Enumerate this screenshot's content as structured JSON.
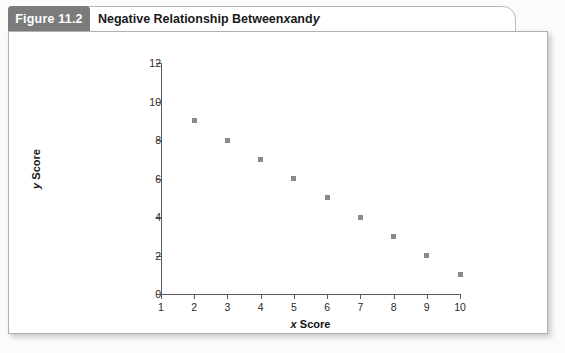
{
  "figure": {
    "number_label": "Figure 11.2",
    "title_prefix": "Negative Relationship Between ",
    "title_var_x": "x",
    "title_middle": " and ",
    "title_var_y": "y"
  },
  "chart_data": {
    "type": "scatter",
    "title": "Negative Relationship Between x and y",
    "xlabel": "x Score",
    "ylabel": "y Score",
    "xlim": [
      1,
      10
    ],
    "ylim": [
      0,
      12
    ],
    "xticks": [
      1,
      2,
      3,
      4,
      5,
      6,
      7,
      8,
      9,
      10
    ],
    "yticks": [
      0,
      2,
      4,
      6,
      8,
      10,
      12
    ],
    "grid": false,
    "legend": false,
    "marker": "square",
    "marker_color": "#8a8a8a",
    "x": [
      2,
      3,
      4,
      5,
      6,
      7,
      8,
      9,
      10
    ],
    "y": [
      9,
      8,
      7,
      6,
      5,
      4,
      3,
      2,
      1
    ],
    "points": [
      {
        "x": 2,
        "y": 9
      },
      {
        "x": 3,
        "y": 8
      },
      {
        "x": 4,
        "y": 7
      },
      {
        "x": 5,
        "y": 6
      },
      {
        "x": 6,
        "y": 5
      },
      {
        "x": 7,
        "y": 4
      },
      {
        "x": 8,
        "y": 3
      },
      {
        "x": 9,
        "y": 2
      },
      {
        "x": 10,
        "y": 1
      }
    ]
  },
  "axis_labels": {
    "x_var": "x",
    "x_word": " Score",
    "y_var": "y",
    "y_word": " Score"
  }
}
